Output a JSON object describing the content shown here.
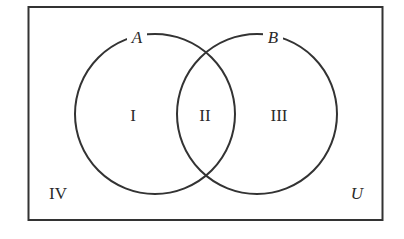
{
  "diagram": {
    "type": "venn",
    "universe_label": "U",
    "sets": [
      {
        "label": "A"
      },
      {
        "label": "B"
      }
    ],
    "regions": {
      "only_a": "I",
      "a_and_b": "II",
      "only_b": "III",
      "outside": "IV"
    },
    "colors": {
      "stroke": "#333333",
      "background": "#ffffff"
    }
  }
}
